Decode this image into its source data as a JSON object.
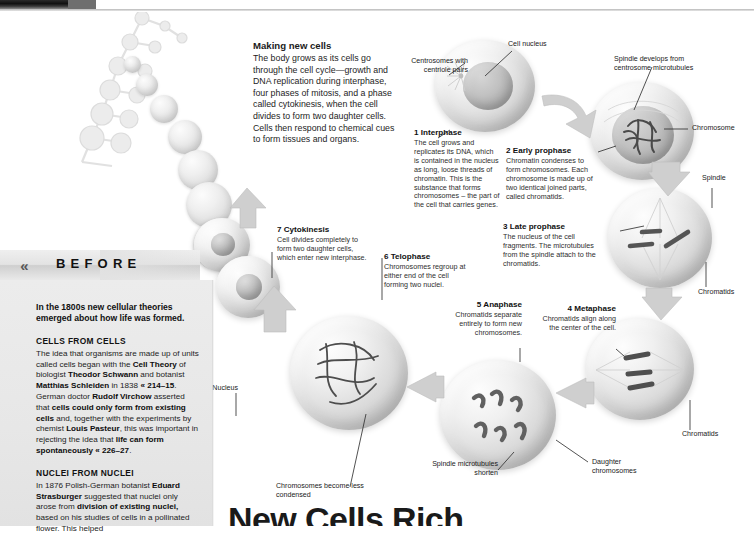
{
  "page": {
    "big_title_partial": "New Cells Rich",
    "accent": "#1b1b1b",
    "panel_bg": "#e9e9e9"
  },
  "intro": {
    "heading": "Making new cells",
    "body": "The body grows as its cells go through the cell cycle—growth and DNA replication during interphase, four phases of mitosis, and a phase called cytokinesis, when the cell divides to form two daughter cells. Cells then respond to chemical cues to form tissues and organs."
  },
  "steps": [
    {
      "num": "1",
      "title": "Interphase",
      "body": "The cell grows and replicates its DNA, which is contained in the nucleus as long, loose threads of chromatin. This is the substance that forms chromosomes – the part of the cell that carries genes."
    },
    {
      "num": "2",
      "title": "Early prophase",
      "body": "Chromatin condenses to form chromosomes. Each chromosome is made up of two identical joined parts, called chromatids."
    },
    {
      "num": "3",
      "title": "Late prophase",
      "body": "The nucleus of the cell fragments. The microtubules from the spindle attach to the chromatids."
    },
    {
      "num": "4",
      "title": "Metaphase",
      "body": "Chromatids align along the center of the cell."
    },
    {
      "num": "5",
      "title": "Anaphase",
      "body": "Chromatids separate entirely to form new chromosomes."
    },
    {
      "num": "6",
      "title": "Telophase",
      "body": "Chromosomes regroup at either end of the cell forming two nuclei."
    },
    {
      "num": "7",
      "title": "Cytokinesis",
      "body": "Cell divides completely to form two daughter cells, which enter new interphase."
    }
  ],
  "callouts": {
    "centrosomes": "Centrosomes with centriole pairs",
    "cell_nucleus": "Cell nucleus",
    "spindle_develops": "Spindle develops from centrosome microtubules",
    "chromosome": "Chromosome",
    "spindle": "Spindle",
    "chromatids_right": "Chromatids",
    "chromatids_lower": "Chromatids",
    "daughter_chromosomes": "Daughter chromosomes",
    "spindle_shorten": "Spindle microtubules shorten",
    "chromosomes_less_condensed": "Chromosomes become less condensed",
    "nucleus": "Nucleus"
  },
  "before": {
    "chevron": "«",
    "label": "BEFORE",
    "lead": "In the 1800s new cellular theories emerged about how life was formed.",
    "sections": [
      {
        "heading": "CELLS FROM CELLS",
        "body_html": "The idea that organisms are made up of units called cells began with the <b>Cell Theory</b> of biologist <b>Theodor Schwann</b> and botanist <b>Matthias Schleiden</b> in 1838 <b>« 214–15</b>. German doctor <b>Rudolf Virchow</b> asserted that <b>cells could only form from existing cells</b> and, together with the experiments by chemist <b>Louis Pasteur</b>, this was important in rejecting the idea that <b>life can form spontaneously « 226–27</b>."
      },
      {
        "heading": "NUCLEI FROM NUCLEI",
        "body_html": "In 1876 Polish-German botanist <b>Eduard Strasburger</b> suggested that nuclei only arose from <b>division of existing nuclei,</b> based on his studies of cells in a pollinated flower. This helped"
      }
    ]
  }
}
